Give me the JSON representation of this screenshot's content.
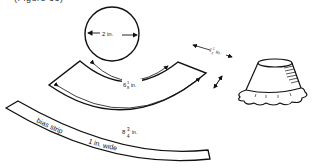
{
  "caption": "(Figure 33)",
  "labels": {
    "circle_diameter": "2 in.",
    "inner_arc": "6 1/8 in.",
    "inner_arc_whole": "6",
    "inner_arc_num": "1",
    "inner_arc_den": "8",
    "outer_arc": "8 3/4 in.",
    "outer_arc_whole": "8",
    "outer_arc_num": "3",
    "outer_arc_den": "4",
    "depth": "1 1/2 in.",
    "depth_whole": "1",
    "depth_num": "1",
    "depth_den": "2",
    "unit": "in.",
    "bias_strip": "bias strip",
    "bias_width": "1 in. wide"
  },
  "colors": {
    "ink": "#111111",
    "paper": "#ffffff"
  }
}
